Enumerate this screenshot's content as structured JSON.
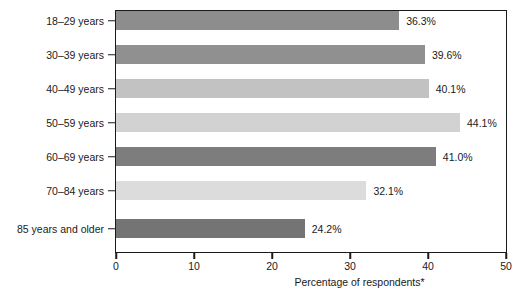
{
  "chart_data": {
    "type": "bar",
    "orientation": "horizontal",
    "title": "",
    "xlabel": "Percentage of respondents*",
    "ylabel": "",
    "xlim": [
      0,
      50
    ],
    "xticks": [
      0,
      10,
      20,
      30,
      40,
      50
    ],
    "xtick_labels": [
      "0",
      "10",
      "20",
      "30",
      "40",
      "50"
    ],
    "grid": false,
    "legend": false,
    "categories": [
      "18–29 years",
      "30–39 years",
      "40–49 years",
      "50–59 years",
      "60–69 years",
      "70–84 years",
      "85 years and older"
    ],
    "values": [
      36.3,
      39.6,
      40.1,
      44.1,
      41.0,
      32.1,
      24.2
    ],
    "value_labels": [
      "36.3%",
      "39.6%",
      "40.1%",
      "44.1%",
      "41.0%",
      "32.1%",
      "24.2%"
    ],
    "bar_colors": [
      "#8d8d8d",
      "#909090",
      "#c2c2c2",
      "#d2d2d2",
      "#7d7d7d",
      "#dcdcdc",
      "#747474"
    ],
    "axis_color": "#1a1a1a",
    "background_color": "#ffffff"
  }
}
